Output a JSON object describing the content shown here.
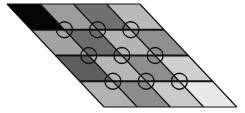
{
  "diagram": {
    "type": "skewed-grid-with-vertex-circles",
    "rows": 4,
    "cols": 4,
    "origin": {
      "x": 7,
      "y": 4
    },
    "cell_width": 33.2,
    "row_height": 25.75,
    "skew_per_row": 24.25,
    "line_color": "#111111",
    "circle": {
      "radius": 8,
      "stroke": "#111111"
    },
    "cells": [
      [
        "#050505",
        "#9c9c9c",
        "#707070",
        "#b9b9b9"
      ],
      [
        "#a2a2a2",
        "#6c6c6c",
        "#b4b4b4",
        "#909090"
      ],
      [
        "#5e5e5e",
        "#b6b6b6",
        "#8e8e8e",
        "#cfcfcf"
      ],
      [
        "#b2b2b2",
        "#8c8c8c",
        "#c9c9c9",
        "#e8e8e8"
      ]
    ],
    "circles_at_interior_vertices": true
  }
}
